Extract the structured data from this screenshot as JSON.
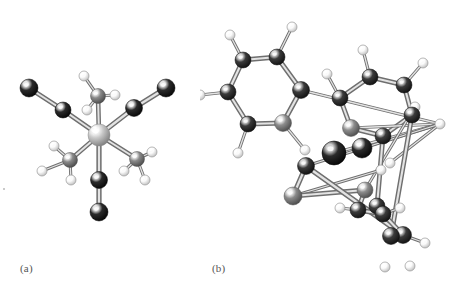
{
  "figure": {
    "type": "molecular-structure-figure",
    "background_color": "#ffffff",
    "panels": [
      {
        "id": "a",
        "label": "(a)",
        "caption_label": "(a)",
        "description": "Ball-and-stick model of an octahedral metal complex with three carbonyl (CO) ligands and three methyl (CH3) groups",
        "atom_legend": [
          {
            "element": "metal",
            "color": "#d8d8d8",
            "role": "central atom"
          },
          {
            "element": "C/O",
            "color": "#242424",
            "role": "carbonyl ligand atoms"
          },
          {
            "element": "C",
            "color": "#808080",
            "role": "methyl carbon"
          },
          {
            "element": "H",
            "color": "#f5f5f5",
            "role": "hydrogen"
          }
        ]
      },
      {
        "id": "b",
        "label": "(b)",
        "caption_label": "(b)",
        "description": "Ball-and-stick model of a triaryl / metal complex with three aromatic six-membered rings and dark ligand atoms on a central metal",
        "atom_legend": [
          {
            "element": "C",
            "color": "#343434",
            "role": "aromatic carbon"
          },
          {
            "element": "C-ipso",
            "color": "#8c8c8c",
            "role": "ring attachment carbon"
          },
          {
            "element": "metal",
            "color": "#1e1e1e",
            "role": "central atom"
          },
          {
            "element": "H",
            "color": "#f7f7f7",
            "role": "hydrogen"
          }
        ]
      }
    ]
  },
  "chart_data": {
    "type": "scatter",
    "title": "",
    "xlabel": "",
    "ylabel": "",
    "note": "Two molecular ball-and-stick renderings; atoms given as screen coordinates with radii and shading classes."
  },
  "structure_a": {
    "label": "(a)",
    "bonds": [
      [
        0,
        1
      ],
      [
        0,
        3
      ],
      [
        0,
        5
      ],
      [
        0,
        7
      ],
      [
        0,
        10
      ],
      [
        0,
        13
      ],
      [
        1,
        2
      ],
      [
        3,
        4
      ],
      [
        5,
        6
      ],
      [
        7,
        8
      ],
      [
        7,
        9
      ],
      [
        7,
        16
      ],
      [
        10,
        11
      ],
      [
        10,
        12
      ],
      [
        10,
        17
      ],
      [
        13,
        14
      ],
      [
        13,
        15
      ],
      [
        13,
        18
      ]
    ],
    "atoms": [
      {
        "n": "M",
        "x": 99,
        "y": 135,
        "r": 11,
        "k": "metal"
      },
      {
        "n": "C1",
        "x": 63,
        "y": 110,
        "r": 8,
        "k": "dark"
      },
      {
        "n": "O1",
        "x": 29,
        "y": 88,
        "r": 9,
        "k": "dark"
      },
      {
        "n": "C2",
        "x": 134,
        "y": 108,
        "r": 8.5,
        "k": "dark"
      },
      {
        "n": "O2",
        "x": 166,
        "y": 88,
        "r": 9,
        "k": "dark"
      },
      {
        "n": "C3",
        "x": 99,
        "y": 180,
        "r": 8.5,
        "k": "dark"
      },
      {
        "n": "O3",
        "x": 99,
        "y": 212,
        "r": 9,
        "k": "dark"
      },
      {
        "n": "C4",
        "x": 98,
        "y": 96,
        "r": 7.5,
        "k": "gray"
      },
      {
        "n": "H1",
        "x": 84,
        "y": 76,
        "r": 5,
        "k": "h"
      },
      {
        "n": "H2",
        "x": 115,
        "y": 95,
        "r": 5,
        "k": "h"
      },
      {
        "n": "C5",
        "x": 70,
        "y": 160,
        "r": 7.5,
        "k": "gray"
      },
      {
        "n": "H3",
        "x": 54,
        "y": 146,
        "r": 5,
        "k": "h"
      },
      {
        "n": "H4",
        "x": 42,
        "y": 171,
        "r": 5,
        "k": "h"
      },
      {
        "n": "C6",
        "x": 137,
        "y": 159,
        "r": 7.5,
        "k": "gray"
      },
      {
        "n": "H5",
        "x": 152,
        "y": 152,
        "r": 5,
        "k": "h"
      },
      {
        "n": "H6",
        "x": 124,
        "y": 171,
        "r": 5,
        "k": "h"
      },
      {
        "n": "H7",
        "x": 87,
        "y": 110,
        "r": 5,
        "k": "h"
      },
      {
        "n": "H8",
        "x": 71,
        "y": 180,
        "r": 5,
        "k": "h"
      },
      {
        "n": "H9",
        "x": 145,
        "y": 180,
        "r": 5,
        "k": "h"
      }
    ]
  },
  "structure_b": {
    "label": "(b)",
    "bonds": [
      [
        0,
        1
      ],
      [
        1,
        2
      ],
      [
        2,
        3
      ],
      [
        3,
        4
      ],
      [
        4,
        5
      ],
      [
        5,
        0
      ],
      [
        0,
        6
      ],
      [
        1,
        7
      ],
      [
        2,
        8
      ],
      [
        3,
        9
      ],
      [
        4,
        10
      ],
      [
        5,
        20
      ],
      [
        11,
        12
      ],
      [
        12,
        13
      ],
      [
        13,
        14
      ],
      [
        14,
        15
      ],
      [
        15,
        16
      ],
      [
        16,
        11
      ],
      [
        12,
        17
      ],
      [
        13,
        18
      ],
      [
        14,
        19
      ],
      [
        15,
        30
      ],
      [
        16,
        31
      ],
      [
        11,
        20
      ],
      [
        20,
        21
      ],
      [
        20,
        22
      ],
      [
        20,
        23
      ],
      [
        20,
        24
      ],
      [
        24,
        25
      ],
      [
        25,
        26
      ],
      [
        26,
        27
      ],
      [
        27,
        28
      ],
      [
        28,
        29
      ],
      [
        29,
        24
      ],
      [
        25,
        32
      ],
      [
        26,
        33
      ],
      [
        27,
        34
      ],
      [
        28,
        35
      ],
      [
        29,
        36
      ]
    ],
    "atoms": [
      {
        "n": "Ca1",
        "x": 277,
        "y": 57,
        "r": 8,
        "k": "ring"
      },
      {
        "n": "Ca2",
        "x": 243,
        "y": 60,
        "r": 8,
        "k": "ring"
      },
      {
        "n": "Ca3",
        "x": 228,
        "y": 92,
        "r": 8,
        "k": "ring"
      },
      {
        "n": "Ca4",
        "x": 248,
        "y": 124,
        "r": 8,
        "k": "ring"
      },
      {
        "n": "Ca5",
        "x": 283,
        "y": 123,
        "r": 8.5,
        "k": "ringlt"
      },
      {
        "n": "Ca6",
        "x": 301,
        "y": 90,
        "r": 8.5,
        "k": "ring"
      },
      {
        "n": "Ha1",
        "x": 292,
        "y": 27,
        "r": 5,
        "k": "h"
      },
      {
        "n": "Ha2",
        "x": 230,
        "y": 35,
        "r": 5,
        "k": "h"
      },
      {
        "n": "Ha3",
        "x": 200,
        "y": 95,
        "r": 5,
        "k": "h"
      },
      {
        "n": "Ha4",
        "x": 238,
        "y": 153,
        "r": 5,
        "k": "h"
      },
      {
        "n": "Ha5",
        "x": 305,
        "y": 150,
        "r": 5,
        "k": "h"
      },
      {
        "n": "Cb1",
        "x": 351,
        "y": 128,
        "r": 8.5,
        "k": "ringlt"
      },
      {
        "n": "Cb2",
        "x": 340,
        "y": 98,
        "r": 8,
        "k": "ring"
      },
      {
        "n": "Cb3",
        "x": 370,
        "y": 77,
        "r": 8,
        "k": "ring"
      },
      {
        "n": "Cb4",
        "x": 404,
        "y": 85,
        "r": 8,
        "k": "ring"
      },
      {
        "n": "Cb5",
        "x": 412,
        "y": 115,
        "r": 8,
        "k": "ring"
      },
      {
        "n": "Cb6",
        "x": 383,
        "y": 136,
        "r": 8,
        "k": "ring"
      },
      {
        "n": "Hb2",
        "x": 327,
        "y": 74,
        "r": 5,
        "k": "h"
      },
      {
        "n": "Hb3",
        "x": 363,
        "y": 50,
        "r": 5,
        "k": "h"
      },
      {
        "n": "Hb4",
        "x": 423,
        "y": 63,
        "r": 5,
        "k": "h"
      },
      {
        "n": "Hb5",
        "x": 440,
        "y": 124,
        "r": 5,
        "k": "h"
      },
      {
        "n": "Hb6",
        "x": 390,
        "y": 163,
        "r": 5,
        "k": "h"
      },
      {
        "n": "M",
        "x": 334,
        "y": 153,
        "r": 12,
        "k": "core"
      },
      {
        "n": "L1",
        "x": 362,
        "y": 148,
        "r": 10,
        "k": "dark"
      },
      {
        "n": "L2",
        "x": 306,
        "y": 166,
        "r": 8.5,
        "k": "darkmid"
      },
      {
        "n": "L3",
        "x": 293,
        "y": 196,
        "r": 9,
        "k": "gray"
      },
      {
        "n": "Cc1",
        "x": 365,
        "y": 190,
        "r": 8,
        "k": "ringlt"
      },
      {
        "n": "Cc2",
        "x": 358,
        "y": 210,
        "r": 8,
        "k": "ring"
      },
      {
        "n": "Cc3",
        "x": 383,
        "y": 214,
        "r": 8,
        "k": "ring"
      },
      {
        "n": "Cc4",
        "x": 403,
        "y": 235,
        "r": 8.5,
        "k": "ring"
      },
      {
        "n": "Cc5",
        "x": 391,
        "y": 236,
        "r": 8.5,
        "k": "ring"
      },
      {
        "n": "Cc6",
        "x": 377,
        "y": 206,
        "r": 8,
        "k": "ring"
      },
      {
        "n": "Hc1",
        "x": 381,
        "y": 170,
        "r": 5,
        "k": "h"
      },
      {
        "n": "Hc2",
        "x": 415,
        "y": 107,
        "r": 5,
        "k": "h"
      },
      {
        "n": "Hc3",
        "x": 340,
        "y": 208,
        "r": 5,
        "k": "h"
      },
      {
        "n": "Hc4",
        "x": 400,
        "y": 208,
        "r": 5,
        "k": "h"
      },
      {
        "n": "Hc5",
        "x": 425,
        "y": 243,
        "r": 5,
        "k": "h"
      },
      {
        "n": "Hc6",
        "x": 410,
        "y": 266,
        "r": 5,
        "k": "h"
      },
      {
        "n": "Hc7",
        "x": 385,
        "y": 267,
        "r": 5,
        "k": "h"
      }
    ]
  }
}
